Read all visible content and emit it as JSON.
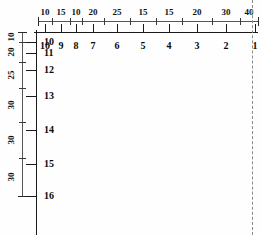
{
  "drawing": {
    "title": "Grid dimension plan",
    "units": "",
    "line_color": "#1a1a1a",
    "dim_color": "#3a3a3a",
    "dash_color": "#8a8a8a",
    "background": "#ffffff"
  },
  "chart_data": {
    "type": "table",
    "xlabel": "",
    "ylabel": "",
    "horizontal_dimension_chain": {
      "labels": [
        "10",
        "15",
        "10",
        "20",
        "25",
        "15",
        "15",
        "20",
        "30",
        "40"
      ],
      "values": [
        10,
        15,
        10,
        20,
        25,
        15,
        15,
        20,
        30,
        40
      ],
      "total": 200,
      "direction": "left-to-right",
      "tick_x": [
        38,
        52,
        70,
        82,
        104,
        130,
        156,
        182,
        212,
        240,
        258
      ],
      "label_x": [
        45,
        61,
        76,
        93,
        117,
        143,
        169,
        197,
        226,
        249
      ],
      "line_y": 21
    },
    "vertical_dimension_chain": {
      "labels": [
        "10",
        "20",
        "25",
        "30",
        "30",
        "30"
      ],
      "values": [
        10,
        20,
        25,
        30,
        30,
        30
      ],
      "total": 145,
      "direction": "top-to-bottom",
      "tick_y": [
        32,
        42,
        62,
        88,
        122,
        158,
        196
      ],
      "label_y": [
        37,
        52,
        75,
        105,
        140,
        177
      ],
      "line_x": 22
    },
    "column_grid_labels": {
      "labels": [
        "10",
        "9",
        "8",
        "7",
        "6",
        "5",
        "4",
        "3",
        "2",
        "1"
      ],
      "x": [
        45,
        61,
        76,
        93,
        117,
        143,
        169,
        197,
        226,
        255
      ],
      "y": 46,
      "axis_y": 32
    },
    "row_grid_labels": {
      "labels": [
        "10",
        "11",
        "12",
        "13",
        "14",
        "15",
        "16"
      ],
      "y": [
        42,
        53,
        70,
        96,
        130,
        164,
        196
      ],
      "x": 44,
      "axis_x": 36
    },
    "right_edge_dashed_line": {
      "x": 252,
      "y_start": 0,
      "y_end": 235,
      "style": "dashed"
    }
  }
}
